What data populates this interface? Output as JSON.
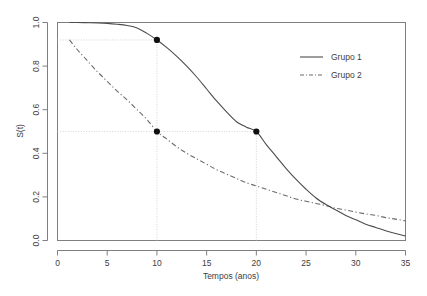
{
  "chart_data": {
    "type": "line",
    "title": "",
    "xlabel": "Tempos (anos)",
    "ylabel": "S(t)",
    "xlim": [
      0,
      35
    ],
    "ylim": [
      0.0,
      1.0
    ],
    "xticks": [
      "0",
      "5",
      "10",
      "15",
      "20",
      "25",
      "30",
      "35"
    ],
    "xtick_values": [
      0,
      5,
      10,
      15,
      20,
      25,
      30,
      35
    ],
    "yticks": [
      "0.0",
      "0.2",
      "0.4",
      "0.6",
      "0.8",
      "1.0"
    ],
    "ytick_values": [
      0.0,
      0.2,
      0.4,
      0.6,
      0.8,
      1.0
    ],
    "grid": false,
    "legend_position": "upper right",
    "series": [
      {
        "name": "Grupo 1",
        "style": "solid",
        "color": "#4d4d4d",
        "x": [
          1.2,
          2,
          3,
          4,
          5,
          6,
          7,
          8,
          9,
          10,
          11,
          12,
          13,
          14,
          15,
          16,
          17,
          18,
          19,
          20,
          21,
          22,
          23,
          24,
          25,
          26,
          27,
          28,
          29,
          30,
          31,
          32,
          33,
          34,
          35
        ],
        "values": [
          1.0,
          1.0,
          0.999,
          0.998,
          0.996,
          0.992,
          0.986,
          0.975,
          0.95,
          0.92,
          0.885,
          0.845,
          0.8,
          0.75,
          0.695,
          0.64,
          0.59,
          0.545,
          0.52,
          0.5,
          0.44,
          0.385,
          0.33,
          0.28,
          0.235,
          0.195,
          0.165,
          0.14,
          0.115,
          0.095,
          0.075,
          0.06,
          0.045,
          0.032,
          0.02
        ]
      },
      {
        "name": "Grupo 2",
        "style": "dashdot",
        "color": "#6b6b6b",
        "x": [
          1.2,
          2,
          3,
          4,
          5,
          6,
          7,
          8,
          9,
          10,
          11,
          12,
          13,
          14,
          15,
          16,
          17,
          18,
          19,
          20,
          21,
          22,
          23,
          24,
          25,
          26,
          27,
          28,
          29,
          30,
          31,
          32,
          33,
          34,
          35
        ],
        "values": [
          0.92,
          0.875,
          0.825,
          0.775,
          0.73,
          0.685,
          0.645,
          0.6,
          0.555,
          0.5,
          0.465,
          0.43,
          0.4,
          0.375,
          0.35,
          0.325,
          0.305,
          0.285,
          0.265,
          0.25,
          0.235,
          0.22,
          0.205,
          0.19,
          0.18,
          0.17,
          0.16,
          0.148,
          0.14,
          0.13,
          0.122,
          0.115,
          0.105,
          0.098,
          0.09
        ]
      }
    ],
    "annotations": {
      "points": [
        {
          "label": "grupo1-at-t10",
          "x": 10,
          "y": 0.92
        },
        {
          "label": "grupo2-median",
          "x": 10,
          "y": 0.5
        },
        {
          "label": "grupo1-median",
          "x": 20,
          "y": 0.5
        }
      ],
      "reference_lines": [
        {
          "label": "h-line-0.92",
          "orientation": "horizontal",
          "y": 0.92,
          "x_from": 0,
          "x_to": 10
        },
        {
          "label": "h-line-0.50",
          "orientation": "horizontal",
          "y": 0.5,
          "x_from": 0,
          "x_to": 20
        },
        {
          "label": "v-line-t10",
          "orientation": "vertical",
          "x": 10,
          "y_from": 0.0,
          "y_to": 0.92
        },
        {
          "label": "v-line-t20",
          "orientation": "vertical",
          "x": 20,
          "y_from": 0.0,
          "y_to": 0.5
        }
      ]
    },
    "legend": [
      {
        "label": "Grupo 1",
        "style": "solid"
      },
      {
        "label": "Grupo 2",
        "style": "dashdot"
      }
    ],
    "colors": {
      "background": "#ffffff",
      "axis": "#7f7f7f",
      "text": "#3d3d3d",
      "series1": "#4d4d4d",
      "series2": "#6b6b6b",
      "reference": "#cfcfcf",
      "marker": "#101010"
    }
  }
}
